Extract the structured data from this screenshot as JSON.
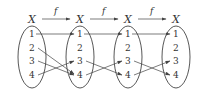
{
  "diagram": {
    "sets": [
      {
        "name": "X",
        "elements": [
          "1",
          "2",
          "3",
          "4"
        ]
      },
      {
        "name": "X",
        "elements": [
          "1",
          "2",
          "3",
          "4"
        ]
      },
      {
        "name": "X",
        "elements": [
          "1",
          "2",
          "3",
          "4"
        ]
      },
      {
        "name": "X",
        "elements": [
          "1",
          "2",
          "3",
          "4"
        ]
      }
    ],
    "function_label": "f",
    "mappings": [
      [
        {
          "from": "1",
          "to": "1"
        },
        {
          "from": "2",
          "to": "4"
        },
        {
          "from": "3",
          "to": "4"
        },
        {
          "from": "4",
          "to": "3"
        }
      ],
      [
        {
          "from": "1",
          "to": "1"
        },
        {
          "from": "3",
          "to": "4"
        },
        {
          "from": "4",
          "to": "3"
        }
      ],
      [
        {
          "from": "1",
          "to": "1"
        },
        {
          "from": "3",
          "to": "4"
        },
        {
          "from": "4",
          "to": "3"
        }
      ]
    ],
    "colors": {
      "stroke": "#444444",
      "text": "#333333"
    }
  }
}
